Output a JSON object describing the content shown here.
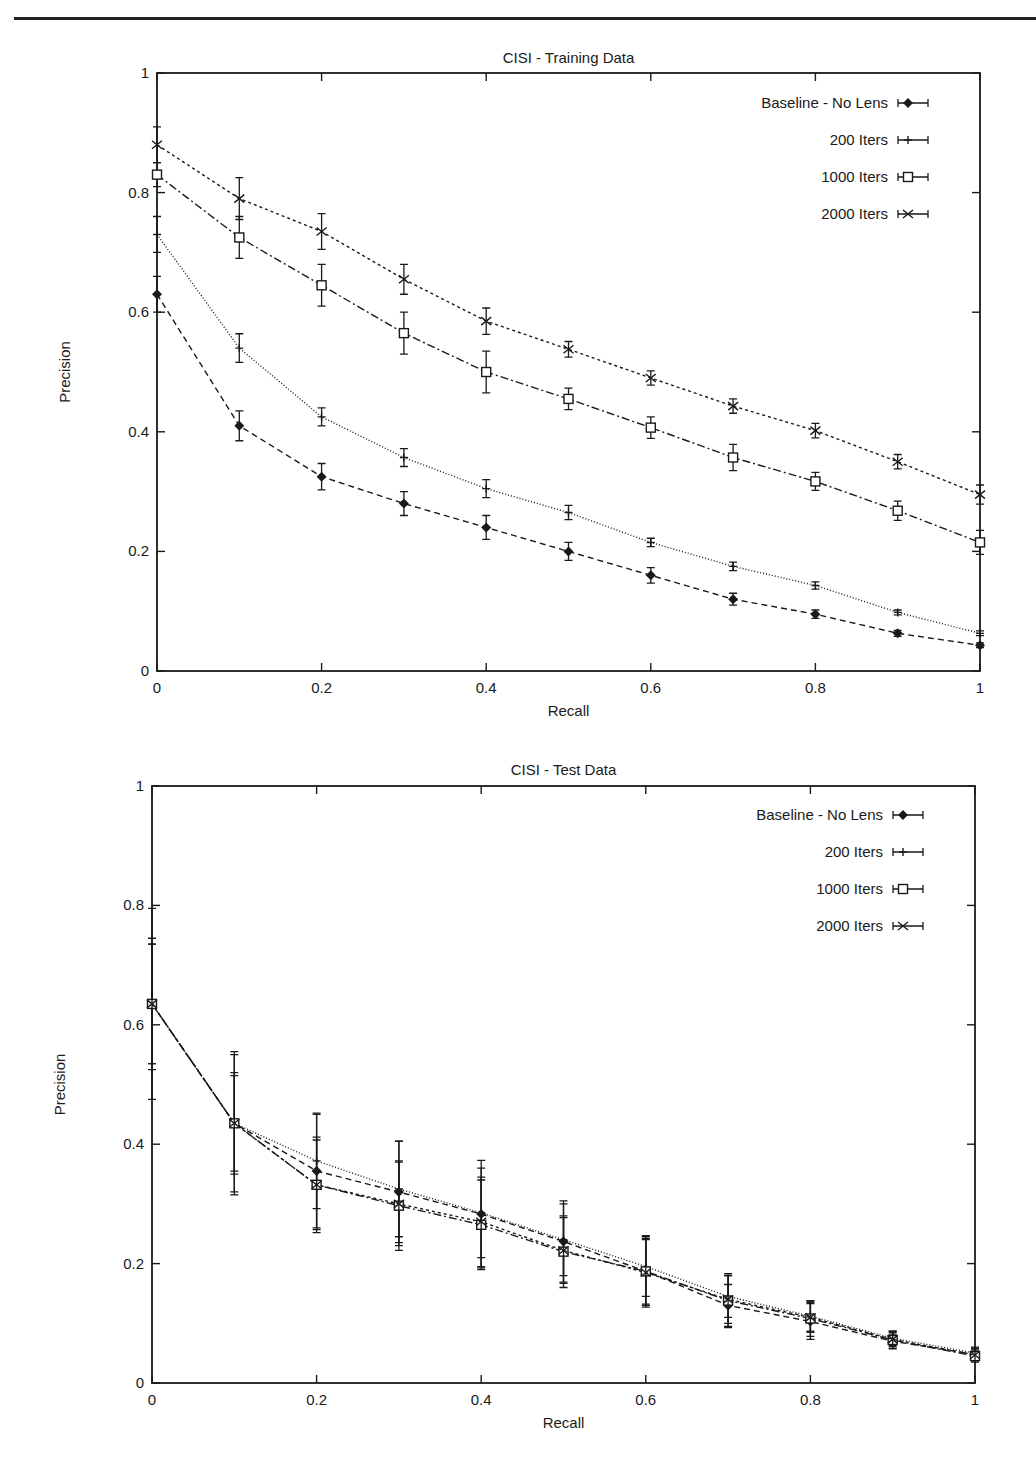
{
  "page": {
    "header_rule": true
  },
  "chart_data": [
    {
      "type": "line",
      "title": "CISI - Training Data",
      "xlabel": "Recall",
      "ylabel": "Precision",
      "xlim": [
        0,
        1
      ],
      "ylim": [
        0,
        1
      ],
      "x": [
        0,
        0.1,
        0.2,
        0.3,
        0.4,
        0.5,
        0.6,
        0.7,
        0.8,
        0.9,
        1.0
      ],
      "xticks": [
        "0",
        "0.2",
        "0.4",
        "0.6",
        "0.8",
        "1"
      ],
      "yticks": [
        "0",
        "0.2",
        "0.4",
        "0.6",
        "0.8",
        "1"
      ],
      "grid": false,
      "legend_position": "top-right",
      "error_bars": true,
      "series": [
        {
          "name": "Baseline - No Lens",
          "marker": "diamond",
          "dash": "6,4",
          "values": [
            0.63,
            0.41,
            0.325,
            0.28,
            0.24,
            0.2,
            0.16,
            0.12,
            0.095,
            0.063,
            0.043
          ],
          "err": [
            0.03,
            0.025,
            0.022,
            0.02,
            0.02,
            0.015,
            0.013,
            0.01,
            0.007,
            0.005,
            0.004
          ]
        },
        {
          "name": "200 Iters",
          "marker": "plus",
          "dash": "1,2",
          "values": [
            0.73,
            0.54,
            0.425,
            0.357,
            0.305,
            0.265,
            0.215,
            0.175,
            0.143,
            0.098,
            0.063
          ],
          "err": [
            0.03,
            0.024,
            0.015,
            0.015,
            0.015,
            0.012,
            0.007,
            0.007,
            0.006,
            0.004,
            0.004
          ]
        },
        {
          "name": "1000 Iters",
          "marker": "square",
          "dash": "8,3,2,3",
          "values": [
            0.83,
            0.725,
            0.645,
            0.565,
            0.5,
            0.455,
            0.407,
            0.357,
            0.317,
            0.268,
            0.215
          ],
          "err": [
            0.02,
            0.035,
            0.035,
            0.035,
            0.035,
            0.018,
            0.018,
            0.022,
            0.015,
            0.016,
            0.02
          ]
        },
        {
          "name": "2000 Iters",
          "marker": "cross",
          "dash": "3,3",
          "values": [
            0.88,
            0.79,
            0.735,
            0.655,
            0.585,
            0.538,
            0.49,
            0.443,
            0.402,
            0.35,
            0.295
          ],
          "err": [
            0.03,
            0.035,
            0.03,
            0.025,
            0.022,
            0.013,
            0.012,
            0.012,
            0.012,
            0.012,
            0.016
          ]
        }
      ]
    },
    {
      "type": "line",
      "title": "CISI - Test Data",
      "xlabel": "Recall",
      "ylabel": "Precision",
      "xlim": [
        0,
        1
      ],
      "ylim": [
        0,
        1
      ],
      "x": [
        0,
        0.1,
        0.2,
        0.3,
        0.4,
        0.5,
        0.6,
        0.7,
        0.8,
        0.9,
        1.0
      ],
      "xticks": [
        "0",
        "0.2",
        "0.4",
        "0.6",
        "0.8",
        "1"
      ],
      "yticks": [
        "0",
        "0.2",
        "0.4",
        "0.6",
        "0.8",
        "1"
      ],
      "grid": false,
      "legend_position": "top-right",
      "error_bars": true,
      "series": [
        {
          "name": "Baseline - No Lens",
          "marker": "diamond",
          "dash": "6,4",
          "values": [
            0.635,
            0.435,
            0.355,
            0.32,
            0.283,
            0.237,
            0.187,
            0.13,
            0.103,
            0.07,
            0.048
          ],
          "err": [
            0.16,
            0.12,
            0.095,
            0.085,
            0.09,
            0.068,
            0.055,
            0.035,
            0.03,
            0.012,
            0.01
          ]
        },
        {
          "name": "200 Iters",
          "marker": "plus",
          "dash": "1,2",
          "values": [
            0.635,
            0.435,
            0.372,
            0.325,
            0.285,
            0.24,
            0.195,
            0.145,
            0.112,
            0.075,
            0.05
          ],
          "err": [
            0.1,
            0.085,
            0.08,
            0.08,
            0.075,
            0.06,
            0.05,
            0.035,
            0.025,
            0.012,
            0.01
          ]
        },
        {
          "name": "1000 Iters",
          "marker": "square",
          "dash": "8,3,2,3",
          "values": [
            0.635,
            0.435,
            0.332,
            0.297,
            0.265,
            0.22,
            0.187,
            0.138,
            0.108,
            0.072,
            0.045
          ],
          "err": [
            0.11,
            0.115,
            0.075,
            0.075,
            0.075,
            0.06,
            0.06,
            0.045,
            0.03,
            0.015,
            0.01
          ]
        },
        {
          "name": "2000 Iters",
          "marker": "cross",
          "dash": "3,3",
          "values": [
            0.635,
            0.435,
            0.332,
            0.3,
            0.27,
            0.222,
            0.185,
            0.14,
            0.11,
            0.073,
            0.047
          ],
          "err": [
            0.1,
            0.08,
            0.08,
            0.07,
            0.075,
            0.055,
            0.055,
            0.04,
            0.025,
            0.012,
            0.01
          ]
        }
      ]
    }
  ]
}
